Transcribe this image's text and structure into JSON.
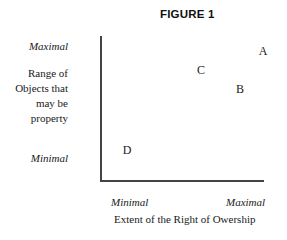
{
  "chart_data": {
    "type": "scatter",
    "title": "FIGURE 1",
    "xlabel": "Extent of the Right of Owership",
    "ylabel": "Range of Objects that may be property",
    "ylabel_lines": [
      "Range of",
      "Objects that",
      "may be",
      "property"
    ],
    "x_tick_labels": [
      "Minimal",
      "Maximal"
    ],
    "y_tick_labels": [
      "Minimal",
      "Maximal"
    ],
    "xlim": [
      0,
      1
    ],
    "ylim": [
      0,
      1
    ],
    "grid": false,
    "legend": null,
    "points": [
      {
        "label": "A",
        "x": 0.99,
        "y": 0.9
      },
      {
        "label": "B",
        "x": 0.85,
        "y": 0.63
      },
      {
        "label": "C",
        "x": 0.61,
        "y": 0.76
      },
      {
        "label": "D",
        "x": 0.16,
        "y": 0.21
      }
    ]
  },
  "figure": {
    "title": "FIGURE 1",
    "y_axis": {
      "max_label": "Maximal",
      "min_label": "Minimal",
      "title_lines": [
        "Range of",
        "Objects that",
        "may be",
        "property"
      ]
    },
    "x_axis": {
      "min_label": "Minimal",
      "max_label": "Maximal",
      "title": "Extent of the Right of Owership"
    },
    "points": [
      {
        "label": "A",
        "left": 263,
        "top": 51
      },
      {
        "label": "B",
        "left": 240,
        "top": 89
      },
      {
        "label": "C",
        "left": 201,
        "top": 70
      },
      {
        "label": "D",
        "left": 127,
        "top": 150
      }
    ]
  }
}
